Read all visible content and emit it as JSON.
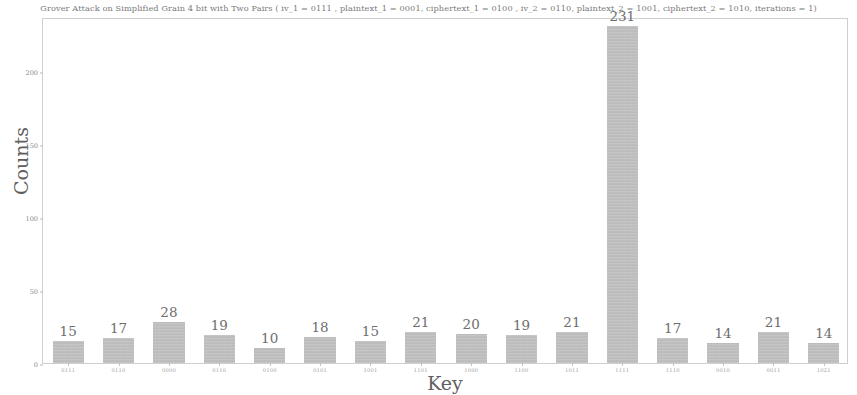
{
  "chart_data": {
    "type": "bar",
    "title": "Grover Attack on Simplified Grain 4 bit with Two Pairs ( iv_1 = 0111 , plaintext_1 = 0001, ciphertext_1 = 0100 , iv_2 = 0110, plaintext_2 = 1001,  ciphertext_2 = 1010, iterations = 1)",
    "xlabel": "Key",
    "ylabel": "Counts",
    "categories": [
      "0111",
      "0110",
      "0000",
      "0110",
      "0100",
      "0101",
      "1001",
      "1101",
      "1000",
      "1100",
      "1011",
      "1111",
      "1110",
      "0010",
      "0011",
      "1021"
    ],
    "values": [
      15,
      17,
      28,
      19,
      10,
      18,
      15,
      21,
      20,
      19,
      21,
      231,
      17,
      14,
      21,
      14
    ],
    "value_labels": [
      "15",
      "17",
      "28",
      "19",
      "10",
      "18",
      "15",
      "21",
      "20",
      "19",
      "21",
      "231",
      "17",
      "14",
      "21",
      "14"
    ],
    "ytick_values": [
      0,
      50,
      100,
      150,
      200
    ],
    "ytick_labels": [
      "0",
      "50",
      "100",
      "150",
      "200"
    ],
    "ylim": [
      0,
      237
    ],
    "grid": false,
    "legend": null,
    "bar_color": "#bcbcbc",
    "axis_color": "#cfcfcf",
    "text_color": "#6e6e6e"
  }
}
